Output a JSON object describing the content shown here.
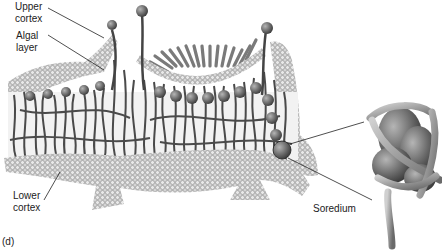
{
  "figure": {
    "panel_label": "(d)",
    "labels": {
      "upper_cortex": [
        "Upper",
        "cortex"
      ],
      "algal_layer": [
        "Algal",
        "layer"
      ],
      "lower_cortex": [
        "Lower",
        "cortex"
      ],
      "soredium": "Soredium"
    },
    "colors": {
      "cortex_fill": "#c9c9c9",
      "cortex_cell": "#8a8a8a",
      "hyphae": "#4a4a4a",
      "algae": "#6a6a6a",
      "soredium_body": "#777777",
      "line": "#222222"
    }
  }
}
